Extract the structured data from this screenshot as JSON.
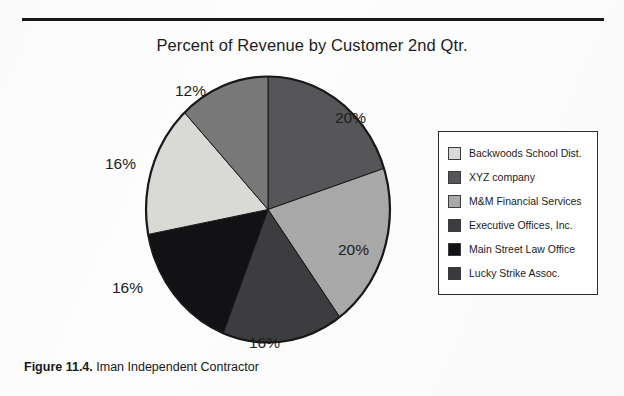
{
  "figure": {
    "caption_bold": "Figure 11.4.",
    "caption_rest": "Iman Independent Contractor"
  },
  "chart_data": {
    "type": "pie",
    "title": "Percent of Revenue by Customer 2nd Qtr.",
    "xlabel": "",
    "ylabel": "",
    "legend_position": "right",
    "start_angle_deg": 0,
    "direction": "clockwise",
    "categories": [
      "XYZ company",
      "M&M Financial Services",
      "Executive Offices, Inc.",
      "Main Street Law Office",
      "Backwoods School Dist.",
      "Lucky Strike Assoc."
    ],
    "values": [
      20,
      20,
      16,
      16,
      16,
      12
    ],
    "value_labels": [
      "20%",
      "20%",
      "16%",
      "16%",
      "16%",
      "12%"
    ],
    "colors": [
      "#565658",
      "#a8a8a8",
      "#3d3d3f",
      "#121214",
      "#d9d9d6",
      "#787878"
    ],
    "slices": [
      {
        "label": "XYZ company",
        "value": 20,
        "display": "20%",
        "color": "#565658"
      },
      {
        "label": "M&M Financial Services",
        "value": 20,
        "display": "20%",
        "color": "#a8a8a8"
      },
      {
        "label": "Executive Offices, Inc.",
        "value": 16,
        "display": "16%",
        "color": "#3d3d3f"
      },
      {
        "label": "Main Street Law Office",
        "value": 16,
        "display": "16%",
        "color": "#121214"
      },
      {
        "label": "Backwoods School Dist.",
        "value": 16,
        "display": "16%",
        "color": "#d9d9d6"
      },
      {
        "label": "Lucky Strike Assoc.",
        "value": 12,
        "display": "12%",
        "color": "#787878"
      }
    ]
  },
  "legend": {
    "items": [
      {
        "label": "Backwoods School Dist.",
        "color": "#d9d9d6"
      },
      {
        "label": "XYZ company",
        "color": "#565658"
      },
      {
        "label": "M&M Financial Services",
        "color": "#a8a8a8"
      },
      {
        "label": "Executive Offices, Inc.",
        "color": "#3d3d3f"
      },
      {
        "label": "Main Street Law Office",
        "color": "#121214"
      },
      {
        "label": "Lucky Strike Assoc.",
        "color": "#3a3a3c"
      }
    ]
  },
  "labels": {
    "pct_top_left": "12%",
    "pct_right_upper": "20%",
    "pct_right_lower": "20%",
    "pct_bottom": "16%",
    "pct_left_upper": "16%",
    "pct_left_lower": "16%"
  }
}
